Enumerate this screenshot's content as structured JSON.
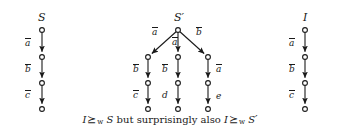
{
  "figure": {
    "width": 340,
    "height": 137,
    "background": "#ffffff",
    "stroke_color": "#1a1a1a",
    "node_fill": "#ffffff"
  },
  "trees": [
    {
      "id": "tree-s",
      "name": "S",
      "name_prime": "",
      "type": "linear-chain",
      "root": {
        "x": 42,
        "y": 30
      },
      "nodes": [
        {
          "x": 42,
          "y": 30
        },
        {
          "x": 42,
          "y": 57
        },
        {
          "x": 42,
          "y": 83
        },
        {
          "x": 42,
          "y": 109
        }
      ],
      "edges": [
        {
          "label": "a",
          "overline": true,
          "from": 0,
          "to": 1,
          "label_x": 25,
          "label_y": 39
        },
        {
          "label": "b",
          "overline": true,
          "from": 1,
          "to": 2,
          "label_x": 25,
          "label_y": 65
        },
        {
          "label": "c",
          "overline": true,
          "from": 2,
          "to": 3,
          "label_x": 25,
          "label_y": 91
        }
      ],
      "name_x": 38,
      "name_y": 12
    },
    {
      "id": "tree-s-prime",
      "name": "S",
      "name_prime": "′",
      "type": "branching",
      "root": {
        "x": 178,
        "y": 30
      },
      "nodes": [
        {
          "x": 178,
          "y": 30
        },
        {
          "x": 148,
          "y": 57
        },
        {
          "x": 178,
          "y": 57
        },
        {
          "x": 208,
          "y": 57
        },
        {
          "x": 148,
          "y": 83
        },
        {
          "x": 178,
          "y": 83
        },
        {
          "x": 208,
          "y": 83
        },
        {
          "x": 148,
          "y": 109
        },
        {
          "x": 178,
          "y": 109
        },
        {
          "x": 208,
          "y": 109
        }
      ],
      "edges": [
        {
          "label": "a",
          "overline": true,
          "from": 0,
          "to": 1,
          "label_x": 152,
          "label_y": 28
        },
        {
          "label": "a",
          "overline": true,
          "from": 0,
          "to": 2,
          "label_x": 172,
          "label_y": 38
        },
        {
          "label": "b",
          "overline": true,
          "from": 0,
          "to": 3,
          "label_x": 196,
          "label_y": 28
        },
        {
          "label": "b",
          "overline": true,
          "from": 1,
          "to": 4,
          "label_x": 133,
          "label_y": 65
        },
        {
          "label": "b",
          "overline": true,
          "from": 2,
          "to": 5,
          "label_x": 162,
          "label_y": 65
        },
        {
          "label": "a",
          "overline": true,
          "from": 3,
          "to": 6,
          "label_x": 216,
          "label_y": 65
        },
        {
          "label": "c",
          "overline": true,
          "from": 4,
          "to": 7,
          "label_x": 133,
          "label_y": 91
        },
        {
          "label": "d",
          "overline": false,
          "from": 5,
          "to": 8,
          "label_x": 162,
          "label_y": 91
        },
        {
          "label": "e",
          "overline": false,
          "from": 6,
          "to": 9,
          "label_x": 216,
          "label_y": 92
        }
      ],
      "name_x": 174,
      "name_y": 12
    },
    {
      "id": "tree-i",
      "name": "I",
      "name_prime": "",
      "type": "linear-chain",
      "root": {
        "x": 305,
        "y": 30
      },
      "nodes": [
        {
          "x": 305,
          "y": 30
        },
        {
          "x": 305,
          "y": 57
        },
        {
          "x": 305,
          "y": 83
        },
        {
          "x": 305,
          "y": 109
        }
      ],
      "edges": [
        {
          "label": "a",
          "overline": true,
          "from": 0,
          "to": 1,
          "label_x": 289,
          "label_y": 39
        },
        {
          "label": "b",
          "overline": true,
          "from": 1,
          "to": 2,
          "label_x": 289,
          "label_y": 65
        },
        {
          "label": "c",
          "overline": true,
          "from": 2,
          "to": 3,
          "label_x": 289,
          "label_y": 91
        }
      ],
      "name_x": 303,
      "name_y": 12
    }
  ],
  "caption": {
    "part1_symbol": "I",
    "relation": "⪰",
    "relation_subscript": "w",
    "part2_symbol": "S",
    "middle_text": "but surprisingly also",
    "part3_symbol": "I",
    "part4_symbol": "S",
    "part4_prime": "′"
  }
}
